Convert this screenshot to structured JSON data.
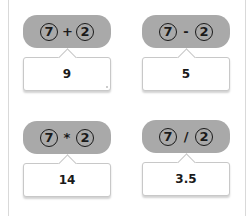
{
  "cards": [
    {
      "a": "7",
      "op": "+",
      "b": "2",
      "result": "9"
    },
    {
      "a": "7",
      "op": "-",
      "b": "2",
      "result": "5"
    },
    {
      "a": "7",
      "op": "*",
      "b": "2",
      "result": "14"
    },
    {
      "a": "7",
      "op": "/",
      "b": "2",
      "result": "3.5"
    }
  ],
  "colors": {
    "pill": "#a9a9a9",
    "border": "#c8c8c8"
  }
}
